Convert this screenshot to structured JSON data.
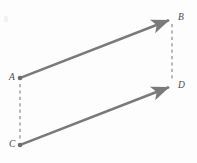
{
  "figure": {
    "kind": "geometry-vector-diagram",
    "background_color": "#fdfdfd",
    "stroke_color": "#7a7a7a",
    "dash_color": "#8c8c8c",
    "label_color": "#4a4a4a",
    "width": 197,
    "height": 163
  },
  "points": {
    "A": {
      "label": "A",
      "x": 20,
      "y": 78
    },
    "B": {
      "label": "B",
      "x": 172,
      "y": 19
    },
    "C": {
      "label": "C",
      "x": 20,
      "y": 145
    },
    "D": {
      "label": "D",
      "x": 172,
      "y": 86
    }
  },
  "vectors": [
    {
      "name": "vector-AB",
      "from": "A",
      "to": "B",
      "x1": 20,
      "y1": 78,
      "x2": 172,
      "y2": 19,
      "style": "solid",
      "arrow_at": "end",
      "dot_at": "start"
    },
    {
      "name": "vector-CD",
      "from": "C",
      "to": "D",
      "x1": 20,
      "y1": 145,
      "x2": 172,
      "y2": 86,
      "style": "solid",
      "arrow_at": "end",
      "dot_at": "start"
    }
  ],
  "connectors": [
    {
      "name": "connector-AC",
      "from": "A",
      "to": "C",
      "x1": 20,
      "y1": 84,
      "x2": 20,
      "y2": 140,
      "style": "dashed"
    },
    {
      "name": "connector-BD",
      "from": "B",
      "to": "D",
      "x1": 172,
      "y1": 24,
      "x2": 172,
      "y2": 81,
      "style": "dashed"
    }
  ]
}
